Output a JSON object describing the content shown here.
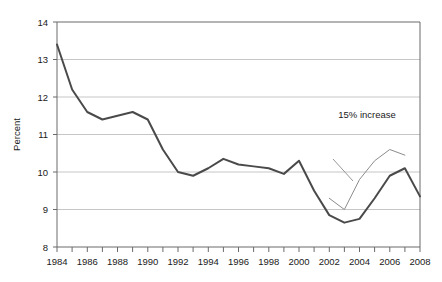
{
  "chart_data": {
    "type": "line",
    "title": "",
    "xlabel": "",
    "ylabel": "Percent",
    "xlim": [
      1984,
      2008
    ],
    "ylim": [
      8,
      14
    ],
    "grid": true,
    "legend": "none",
    "x": [
      1984,
      1985,
      1986,
      1987,
      1988,
      1989,
      1990,
      1991,
      1992,
      1993,
      1994,
      1995,
      1996,
      1997,
      1998,
      1999,
      2000,
      2001,
      2002,
      2003,
      2004,
      2005,
      2006,
      2007,
      2008
    ],
    "series": [
      {
        "name": "Percent",
        "values": [
          13.4,
          12.2,
          11.6,
          11.4,
          11.5,
          11.6,
          11.4,
          10.6,
          10.0,
          9.9,
          10.1,
          10.35,
          10.2,
          10.15,
          10.1,
          9.95,
          10.3,
          9.5,
          8.85,
          8.65,
          8.75,
          9.3,
          9.9,
          10.1,
          9.35
        ]
      },
      {
        "name": "15% increase reference",
        "values": [
          null,
          null,
          null,
          null,
          null,
          null,
          null,
          null,
          null,
          null,
          null,
          null,
          null,
          null,
          null,
          null,
          null,
          null,
          9.3,
          9.0,
          9.8,
          10.3,
          10.6,
          10.45,
          null
        ]
      }
    ],
    "y_ticks": [
      8,
      9,
      10,
      11,
      12,
      13,
      14
    ],
    "y_tick_labels": [
      "8",
      "9",
      "10",
      "11",
      "12",
      "13",
      "14"
    ],
    "x_ticks": [
      1984,
      1985,
      1986,
      1987,
      1988,
      1989,
      1990,
      1991,
      1992,
      1993,
      1994,
      1995,
      1996,
      1997,
      1998,
      1999,
      2000,
      2001,
      2002,
      2003,
      2004,
      2005,
      2006,
      2007,
      2008
    ],
    "x_tick_labels": [
      "1984",
      "",
      "1986",
      "",
      "1988",
      "",
      "1990",
      "",
      "1992",
      "",
      "1994",
      "",
      "1996",
      "",
      "1998",
      "",
      "2000",
      "",
      "2002",
      "",
      "2004",
      "",
      "2006",
      "",
      "2008"
    ],
    "x_labeled_ticks": [
      "1984",
      "1986",
      "1988",
      "1990",
      "1992",
      "1994",
      "1996",
      "1998",
      "2000",
      "2002",
      "2004",
      "2006",
      "2008"
    ],
    "annotations": [
      {
        "text": "15% increase",
        "x": 2002.6,
        "y": 11.45
      }
    ],
    "colors": {
      "series_main": "#4a4a4a",
      "series_ghost": "#8c8c8c",
      "gridline": "#b8b8b8",
      "axis": "#6b6b6b",
      "text": "#1a1a1a",
      "background": "#ffffff"
    }
  },
  "axes": {
    "y_title": "Percent",
    "y_tick_labels": [
      "14",
      "13",
      "12",
      "11",
      "10",
      "9",
      "8"
    ],
    "x_tick_labels": [
      "1984",
      "1986",
      "1988",
      "1990",
      "1992",
      "1994",
      "1996",
      "1998",
      "2000",
      "2002",
      "2004",
      "2006",
      "2008"
    ]
  },
  "annotation": {
    "label": "15% increase"
  }
}
